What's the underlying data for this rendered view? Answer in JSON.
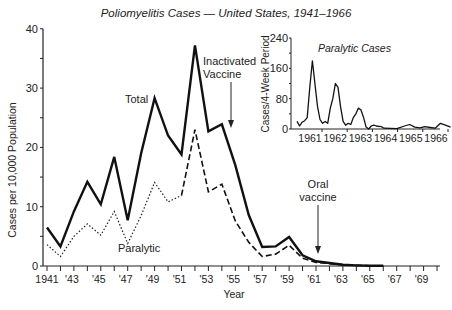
{
  "chart_data": [
    {
      "type": "line",
      "title": "Poliomyelitis Cases — United States, 1941–1966",
      "xlabel": "Year",
      "ylabel": "Cases per 10,000 Population",
      "ylim": [
        0,
        40
      ],
      "yticks": [
        0,
        10,
        20,
        30,
        40
      ],
      "xlim": [
        1941,
        1970
      ],
      "xtick_labels": [
        "1941",
        "'43",
        "'45",
        "'47",
        "'49",
        "'51",
        "'53",
        "'55",
        "'57",
        "'59",
        "'61",
        "'63",
        "'65",
        "'67",
        "'69"
      ],
      "grid": false,
      "x": [
        1941,
        1942,
        1943,
        1944,
        1945,
        1946,
        1947,
        1948,
        1949,
        1950,
        1951,
        1952,
        1953,
        1954,
        1955,
        1956,
        1957,
        1958,
        1959,
        1960,
        1961,
        1962,
        1963,
        1964,
        1965,
        1966
      ],
      "series": [
        {
          "name": "Total",
          "style": "solid",
          "values": [
            6.5,
            3.3,
            9.2,
            14.2,
            10.4,
            18.4,
            7.7,
            19.0,
            28.3,
            22.0,
            18.8,
            37.2,
            22.7,
            23.9,
            17.0,
            8.6,
            3.2,
            3.3,
            4.9,
            1.8,
            0.8,
            0.5,
            0.2,
            0.1,
            0.05,
            0.05
          ]
        },
        {
          "name": "Paralytic",
          "style": "dotted-then-dashed",
          "values": [
            3.6,
            1.6,
            5.0,
            7.1,
            5.2,
            9.2,
            3.8,
            8.5,
            14.1,
            10.8,
            11.9,
            23.0,
            12.5,
            13.8,
            7.6,
            4.0,
            1.6,
            2.0,
            3.5,
            1.3,
            0.6,
            0.4,
            0.2,
            0.1,
            0.05,
            0.05
          ]
        }
      ],
      "annotations": [
        {
          "text": "Total",
          "near_year": 1949
        },
        {
          "text": "Paralytic",
          "near_year": 1948
        },
        {
          "text": "Inactivated Vaccine",
          "arrow_year": 1955,
          "arrow_value": 23
        },
        {
          "text": "Oral vaccine",
          "arrow_year": 1961,
          "arrow_value": 1
        }
      ]
    },
    {
      "type": "line",
      "title": "Paralytic Cases",
      "ylabel": "Cases/4-Week Period",
      "ylim": [
        0,
        240
      ],
      "yticks": [
        0,
        80,
        160,
        240
      ],
      "xtick_labels": [
        "1961",
        "1962",
        "1963",
        "1964",
        "1965",
        "1966"
      ],
      "grid": false,
      "series": [
        {
          "name": "Paralytic Cases (4-week periods)",
          "x": [
            1960.6,
            1960.7,
            1960.8,
            1960.9,
            1961.0,
            1961.1,
            1961.2,
            1961.3,
            1961.4,
            1961.5,
            1961.6,
            1961.7,
            1961.8,
            1961.9,
            1962.0,
            1962.1,
            1962.2,
            1962.3,
            1962.4,
            1962.5,
            1962.6,
            1962.7,
            1962.8,
            1962.9,
            1963.0,
            1963.1,
            1963.2,
            1963.3,
            1963.4,
            1963.5,
            1963.6,
            1963.7,
            1963.8,
            1963.9,
            1964.0,
            1964.5,
            1964.8,
            1965.0,
            1965.2,
            1965.4,
            1965.6,
            1965.8,
            1966.0,
            1966.2,
            1966.4,
            1966.6
          ],
          "values": [
            20,
            8,
            18,
            22,
            30,
            110,
            180,
            120,
            60,
            25,
            15,
            20,
            15,
            55,
            80,
            120,
            110,
            60,
            20,
            10,
            15,
            12,
            30,
            40,
            55,
            50,
            30,
            5,
            0,
            8,
            10,
            8,
            7,
            6,
            2,
            1,
            8,
            12,
            5,
            3,
            6,
            4,
            2,
            15,
            10,
            5
          ]
        }
      ]
    }
  ],
  "labels": {
    "title": "Poliomyelitis Cases — United States, 1941–1966",
    "ylabel": "Cases per 10,000 Population",
    "xlabel": "Year",
    "total": "Total",
    "paralytic": "Paralytic",
    "inactivated_1": "Inactivated",
    "inactivated_2": "Vaccine",
    "oral_1": "Oral",
    "oral_2": "vaccine",
    "inset_title": "Paralytic Cases",
    "inset_ylabel": "Cases/4-Week Period"
  }
}
